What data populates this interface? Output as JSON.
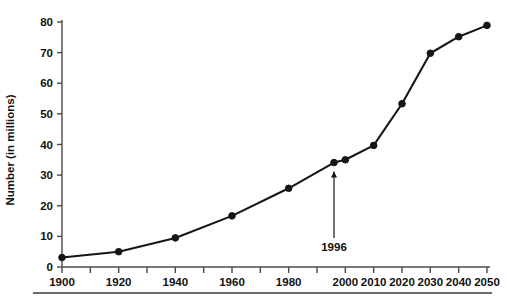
{
  "chart_data": {
    "type": "line",
    "title": "",
    "xlabel": "",
    "ylabel": "Number (in millions)",
    "xlim": [
      1900,
      2050
    ],
    "ylim": [
      0,
      80
    ],
    "grid": false,
    "legend": "none",
    "x": [
      1900,
      1920,
      1940,
      1960,
      1980,
      1996,
      2000,
      2010,
      2020,
      2030,
      2040,
      2050
    ],
    "values": [
      3.1,
      5.0,
      9.5,
      16.7,
      25.7,
      34.1,
      35.0,
      39.7,
      53.3,
      69.8,
      75.2,
      78.9
    ],
    "series": [
      {
        "name": "Number (in millions)",
        "values": [
          3.1,
          5.0,
          9.5,
          16.7,
          25.7,
          34.1,
          35.0,
          39.7,
          53.3,
          69.8,
          75.2,
          78.9
        ]
      }
    ],
    "x_tick_values": [
      1900,
      1910,
      1920,
      1930,
      1940,
      1950,
      1960,
      1970,
      1980,
      1990,
      2000,
      2010,
      2020,
      2030,
      2040,
      2050
    ],
    "x_tick_labels": [
      "1900",
      "",
      "1920",
      "",
      "1940",
      "",
      "1960",
      "",
      "1980",
      "",
      "2000",
      "2010",
      "2020",
      "2030",
      "2040",
      "2050"
    ],
    "y_tick_values": [
      0,
      10,
      20,
      30,
      40,
      50,
      60,
      70,
      80
    ],
    "y_tick_labels": [
      "0",
      "10",
      "20",
      "30",
      "40",
      "50",
      "60",
      "70",
      "80"
    ],
    "annotations": [
      {
        "text": "1996",
        "x": 1996,
        "y": 34.1,
        "style": "vertical-arrow-up"
      }
    ],
    "colors": {
      "line": "#161616",
      "marker": "#161616",
      "axis": "#4a4a4a",
      "text": "#111111",
      "background": "#ffffff",
      "footer_rule": "#3a3a3a"
    }
  }
}
